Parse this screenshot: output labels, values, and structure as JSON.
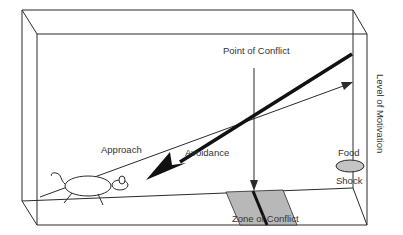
{
  "diagram": {
    "labels": {
      "point_of_conflict": "Point of Conflict",
      "approach": "Approach",
      "avoidance": "Avoidance",
      "level_of_motivation": "Level of Motivation",
      "food": "Food",
      "shock": "Shock",
      "zone_of_conflict": "Zone of Conflict"
    },
    "colors": {
      "line": "#2a2a2a",
      "zone_fill": "#b8b8b8",
      "goal_fill": "#c4c4c4",
      "text": "#333333"
    }
  }
}
